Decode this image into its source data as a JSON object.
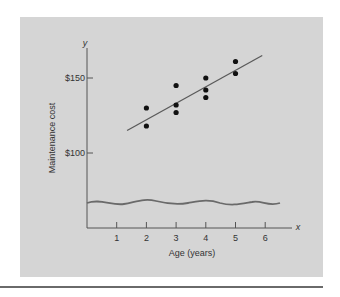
{
  "chart_data": {
    "type": "scatter",
    "title": "",
    "xlabel": "Age (years)",
    "ylabel": "Maintenance cost",
    "x_axis_symbol": "x",
    "y_axis_symbol": "y",
    "x_ticks": [
      1,
      2,
      3,
      4,
      5,
      6
    ],
    "x_tick_labels": [
      "1",
      "2",
      "3",
      "4",
      "5",
      "6"
    ],
    "y_ticks": [
      100,
      150
    ],
    "y_tick_labels": [
      "$100",
      "$150"
    ],
    "xlim": [
      0,
      6.5
    ],
    "ylim_note": "y-axis broken below $100 (wavy break line)",
    "grid": false,
    "legend": null,
    "series": [
      {
        "name": "observations",
        "points": [
          {
            "x": 2,
            "y": 130
          },
          {
            "x": 2,
            "y": 118
          },
          {
            "x": 3,
            "y": 145
          },
          {
            "x": 3,
            "y": 132
          },
          {
            "x": 3,
            "y": 127
          },
          {
            "x": 4,
            "y": 150
          },
          {
            "x": 4,
            "y": 142
          },
          {
            "x": 4,
            "y": 137
          },
          {
            "x": 5,
            "y": 161
          },
          {
            "x": 5,
            "y": 153
          }
        ]
      }
    ],
    "fit_line": {
      "x0": 1.35,
      "y0": 115,
      "x1": 5.9,
      "y1": 165
    }
  },
  "colors": {
    "panel": "#d5d5d5",
    "points": "#111111",
    "line": "#5a5a5a",
    "axis": "#555555"
  }
}
